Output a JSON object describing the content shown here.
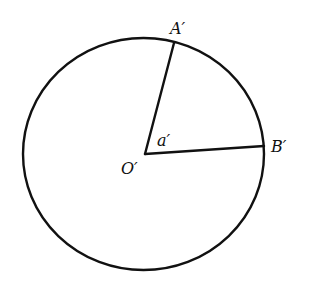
{
  "diagram": {
    "stroke_color": "#111111",
    "background": "#ffffff",
    "circle": {
      "cx": 143.5,
      "cy": 154,
      "rx": 120.5,
      "ry": 116,
      "stroke_width": 2.4
    },
    "center": {
      "name": "O'",
      "x": 145,
      "y": 154
    },
    "points": [
      {
        "name": "A'",
        "x": 174,
        "y": 43
      },
      {
        "name": "B'",
        "x": 264,
        "y": 146
      }
    ],
    "segments": [
      {
        "from": "O'",
        "to": "A'"
      },
      {
        "from": "O'",
        "to": "B'"
      }
    ],
    "labels": {
      "A": "A′",
      "B": "B′",
      "O": "O′",
      "angle": "a′"
    }
  }
}
